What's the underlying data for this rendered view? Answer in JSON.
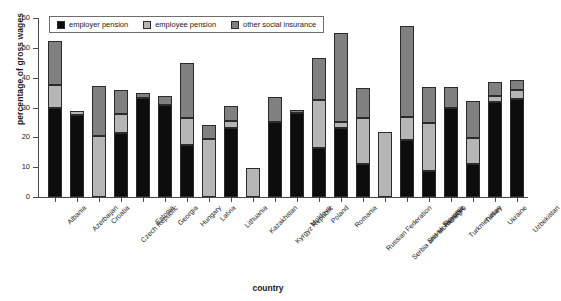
{
  "chart_data": {
    "type": "bar",
    "subtype": "stacked-bar",
    "title": "",
    "xlabel": "country",
    "ylabel": "percentage of gross wages",
    "ylim": [
      0,
      60
    ],
    "yticks": [
      0,
      10,
      20,
      30,
      40,
      50,
      60
    ],
    "grid": false,
    "legend_position": "top-left",
    "categories": [
      "Albania",
      "Azerbaijan",
      "Croatia",
      "Czech Republic",
      "Estonia",
      "Georgia",
      "Hungary",
      "Latvia",
      "Lithuania",
      "Kazakhstan",
      "Kyrgyz Republic",
      "Moldova",
      "Poland",
      "Romania",
      "Russian Federation",
      "Serbia and Montenegro",
      "Slovak Republic",
      "Slovenia",
      "Turkmenistan",
      "Turkey",
      "Ukraine",
      "Uzbekistan"
    ],
    "series": [
      {
        "name": "employer pension",
        "color": "#0d0d0d",
        "values": [
          29.7,
          27.4,
          0.0,
          21.4,
          33.2,
          30.7,
          17.6,
          0.0,
          23.2,
          0.0,
          25.3,
          28.1,
          16.4,
          23.2,
          10.9,
          0.0,
          19.0,
          8.7,
          30.0,
          11.0,
          32.0,
          32.7
        ]
      },
      {
        "name": "employee pension",
        "color": "#b5b5b5",
        "values": [
          7.8,
          1.4,
          20.3,
          6.5,
          0.0,
          0.0,
          8.8,
          19.6,
          2.2,
          9.8,
          0.0,
          0.0,
          16.0,
          2.0,
          15.7,
          21.7,
          7.7,
          16.1,
          0.0,
          8.8,
          2.0,
          3.2
        ]
      },
      {
        "name": "other social insurance",
        "color": "#808080",
        "values": [
          14.7,
          0.0,
          17.0,
          8.0,
          1.7,
          3.3,
          18.6,
          4.6,
          5.2,
          0.0,
          8.2,
          1.2,
          14.1,
          29.7,
          10.0,
          0.0,
          30.5,
          12.2,
          7.0,
          12.5,
          4.7,
          3.2
        ]
      }
    ],
    "totals": [
      52.2,
      28.8,
      37.3,
      35.9,
      34.9,
      34.0,
      45.0,
      24.2,
      30.6,
      9.8,
      33.5,
      29.3,
      46.5,
      54.9,
      36.6,
      21.7,
      57.2,
      37.0,
      37.0,
      32.3,
      38.7,
      39.1
    ]
  },
  "legend": {
    "items": [
      {
        "label": "employer pension"
      },
      {
        "label": "employee pension"
      },
      {
        "label": "other social insurance"
      }
    ]
  }
}
